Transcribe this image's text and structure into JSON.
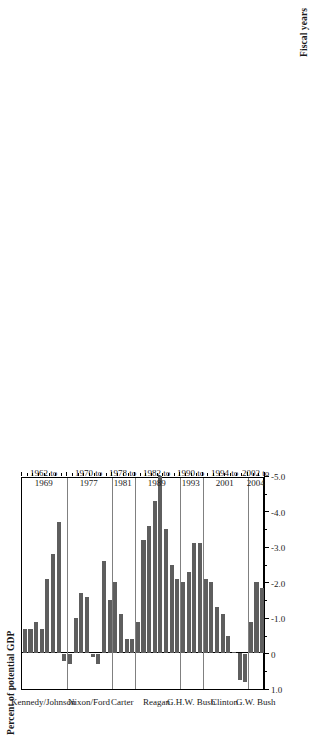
{
  "figure": {
    "value_axis_title": "Percent of potential GDP",
    "category_axis_title": "Fiscal years",
    "bar_color": "#5e5e5e",
    "frame_color": "#000000",
    "separator_color": "#808080"
  },
  "chart_data": {
    "type": "bar",
    "orientation": "horizontal",
    "title": "",
    "xlabel": "Fiscal years",
    "ylabel": "Percent of potential GDP",
    "xlim": [
      1.0,
      -5.0
    ],
    "axis_direction": "decreasing",
    "grid": false,
    "legend": "none",
    "tick_labels": [
      "1.0",
      "0",
      "-1.0",
      "-2.0",
      "-3.0",
      "-4.0",
      "-5.0"
    ],
    "tick_values": [
      1.0,
      0,
      -1.0,
      -2.0,
      -3.0,
      -4.0,
      -5.0
    ],
    "minor_tick_values": [
      0.5,
      -0.5,
      -1.5,
      -2.5,
      -3.5,
      -4.5
    ],
    "groups": [
      {
        "name": "Kennedy/Johnson",
        "span_label_line1": "1962 to",
        "span_label_line2": "1969",
        "years": [
          1962,
          1963,
          1964,
          1965,
          1966,
          1967,
          1968,
          1969
        ],
        "values": [
          -0.7,
          -0.7,
          -0.9,
          -0.7,
          -2.1,
          -2.8,
          -3.7,
          0.2
        ]
      },
      {
        "name": "Nixon/Ford",
        "span_label_line1": "1970 to",
        "span_label_line2": "1977",
        "years": [
          1970,
          1971,
          1972,
          1973,
          1974,
          1975,
          1976,
          1977
        ],
        "values": [
          0.3,
          -1.0,
          -1.7,
          -1.6,
          0.1,
          0.3,
          -2.6,
          -1.5
        ]
      },
      {
        "name": "Carter",
        "span_label_line1": "1978 to",
        "span_label_line2": "1981",
        "years": [
          1978,
          1979,
          1980,
          1981
        ],
        "values": [
          -2.0,
          -1.1,
          -0.4,
          -0.4
        ]
      },
      {
        "name": "Reagan",
        "span_label_line1": "1982 to",
        "span_label_line2": "1989",
        "years": [
          1982,
          1983,
          1984,
          1985,
          1986,
          1987,
          1988,
          1989
        ],
        "values": [
          -0.9,
          -3.2,
          -3.6,
          -4.3,
          -5.0,
          -3.5,
          -2.5,
          -2.1
        ]
      },
      {
        "name": "G.H.W. Bush",
        "span_label_line1": "1990 to",
        "span_label_line2": "1993",
        "years": [
          1990,
          1991,
          1992,
          1993
        ],
        "values": [
          -2.0,
          -2.3,
          -3.1,
          -3.1
        ]
      },
      {
        "name": "Clinton",
        "span_label_line1": "1994 to",
        "span_label_line2": "2001",
        "years": [
          1994,
          1995,
          1996,
          1997,
          1998,
          1999,
          2000,
          2001
        ],
        "values": [
          -2.1,
          -2.0,
          -1.3,
          -1.1,
          -0.5,
          0.0,
          0.75,
          0.8
        ]
      },
      {
        "name": "G.W. Bush",
        "span_label_line1": "2002 to",
        "span_label_line2": "2004",
        "years": [
          2002,
          2003,
          2004
        ],
        "values": [
          -0.9,
          -2.0,
          -1.85
        ]
      }
    ]
  }
}
